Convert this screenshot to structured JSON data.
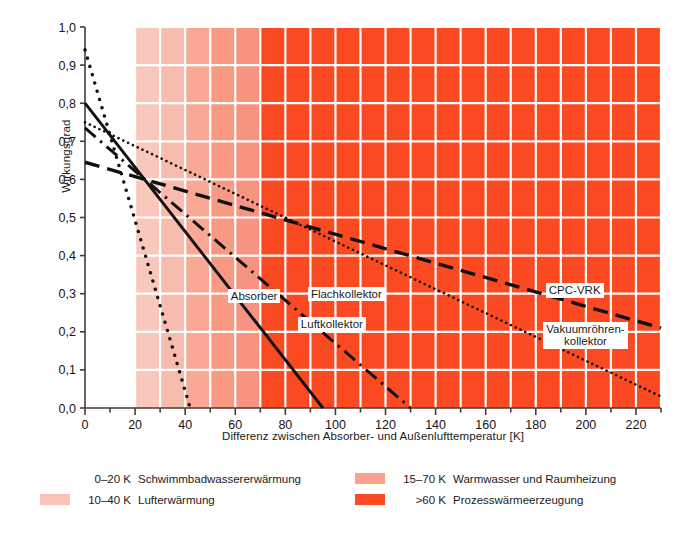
{
  "chart_data": {
    "type": "line",
    "title": "",
    "xlabel": "Differenz zwischen Absorber- und Außenlufttemperatur [K]",
    "ylabel": "Wirkungsgrad",
    "xlim": [
      0,
      230
    ],
    "ylim": [
      0,
      1.0
    ],
    "xticks": [
      0,
      20,
      40,
      60,
      80,
      100,
      120,
      140,
      160,
      180,
      200,
      220
    ],
    "xticklabels": [
      "0",
      "20",
      "40",
      "60",
      "80",
      "100",
      "120",
      "140",
      "160",
      "180",
      "200",
      "220"
    ],
    "yticks": [
      0.0,
      0.1,
      0.2,
      0.3,
      0.4,
      0.5,
      0.6,
      0.7,
      0.8,
      0.9,
      1.0
    ],
    "yticklabels": [
      "0,0",
      "0,1",
      "0,2",
      "0,3",
      "0,4",
      "0,5",
      "0,6",
      "0,7",
      "0,8",
      "0,9",
      "1,0"
    ],
    "grid": true,
    "grid_color": "#ffffff",
    "minor_xtick_step": 10,
    "legend_position": "below-plot",
    "series": [
      {
        "name": "Absorber",
        "style": "dotted-thick",
        "x": [
          0,
          42
        ],
        "y": [
          0.94,
          0.0
        ],
        "label_x": 57,
        "label_y": 0.29
      },
      {
        "name": "Luftkollektor",
        "style": "solid",
        "x": [
          0,
          95
        ],
        "y": [
          0.8,
          0.0
        ],
        "label_x": 85,
        "label_y": 0.215
      },
      {
        "name": "Flachkollektor",
        "style": "dash-dot",
        "x": [
          0,
          130
        ],
        "y": [
          0.735,
          0.0
        ],
        "label_x": 89,
        "label_y": 0.295
      },
      {
        "name": "CPC-VRK",
        "style": "dashed-long",
        "x": [
          0,
          230
        ],
        "y": [
          0.645,
          0.21
        ],
        "label_x": 184,
        "label_y": 0.305
      },
      {
        "name": "Vakuumröhren-kollektor",
        "style": "dotted-fine",
        "x": [
          0,
          230
        ],
        "y": [
          0.75,
          0.03
        ],
        "label_x": 183,
        "label_y": 0.185
      }
    ],
    "bands": [
      {
        "from": 0,
        "to": 20,
        "color": "#ffffff"
      },
      {
        "from": 20,
        "to": 30,
        "color": "#f9c8bd"
      },
      {
        "from": 30,
        "to": 40,
        "color": "#f8bcae"
      },
      {
        "from": 40,
        "to": 50,
        "color": "#f9a895"
      },
      {
        "from": 50,
        "to": 60,
        "color": "#f79983"
      },
      {
        "from": 60,
        "to": 70,
        "color": "#f79481"
      },
      {
        "from": 70,
        "to": 230,
        "color": "#fb4a21"
      }
    ]
  },
  "legend": {
    "left": [
      {
        "swatch": "#ffffff",
        "range": "0–20 K",
        "text": "Schwimmbadwassererwärmung"
      },
      {
        "swatch": "#f9c3b6",
        "range": "10–40 K",
        "text": "Lufterwärmung"
      }
    ],
    "right": [
      {
        "swatch": "#f9a38e",
        "range": "15–70 K",
        "text": "Warmwasser und Raumheizung"
      },
      {
        "swatch": "#fb4a21",
        "range": ">60 K",
        "text": "Prozesswärmeerzeugung"
      }
    ]
  },
  "colors": {
    "band_hot": "#fb4a21",
    "band_warm": "#f9a38e",
    "band_light": "#f9c3b6",
    "grid": "#ffffff",
    "axis": "#4a3a36",
    "curve": "#111111"
  }
}
